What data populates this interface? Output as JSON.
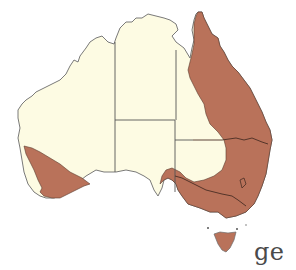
{
  "map": {
    "subject": "Australia distribution map",
    "colors": {
      "land": "#fdfbe3",
      "range": "#b9725a",
      "border": "#555555",
      "coast": "#6b6b6b",
      "background": "#ffffff"
    },
    "regions": [
      {
        "id": "WA",
        "name": "Western Australia",
        "shaded": "southwest corner"
      },
      {
        "id": "NT",
        "name": "Northern Territory",
        "shaded": "none"
      },
      {
        "id": "SA",
        "name": "South Australia",
        "shaded": "southeast edge"
      },
      {
        "id": "QLD",
        "name": "Queensland",
        "shaded": "eastern coast and Cape York"
      },
      {
        "id": "NSW",
        "name": "New South Wales",
        "shaded": "mostly"
      },
      {
        "id": "VIC",
        "name": "Victoria",
        "shaded": "entire"
      },
      {
        "id": "TAS",
        "name": "Tasmania",
        "shaded": "entire"
      }
    ],
    "legend": "Shaded area indicates distribution range"
  },
  "caption": {
    "partial_text": "ge"
  }
}
